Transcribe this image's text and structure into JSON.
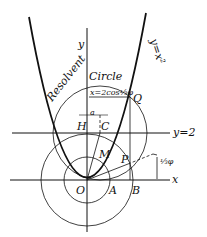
{
  "diagram": {
    "title": "Resolvent Circle",
    "curve_label": "y=x²",
    "line_label": "y=2",
    "x_axis_label": "x",
    "y_axis_label": "y",
    "chord_label": "x=2cos⅓φ",
    "offset_label": "a",
    "angle_label": "⅓φ",
    "points": {
      "O": "O",
      "A": "A",
      "B": "B",
      "P": "P",
      "Q": "Q",
      "M": "M",
      "H": "H",
      "C": "C"
    },
    "colors": {
      "ink": "#111111",
      "background": "#ffffff"
    }
  }
}
